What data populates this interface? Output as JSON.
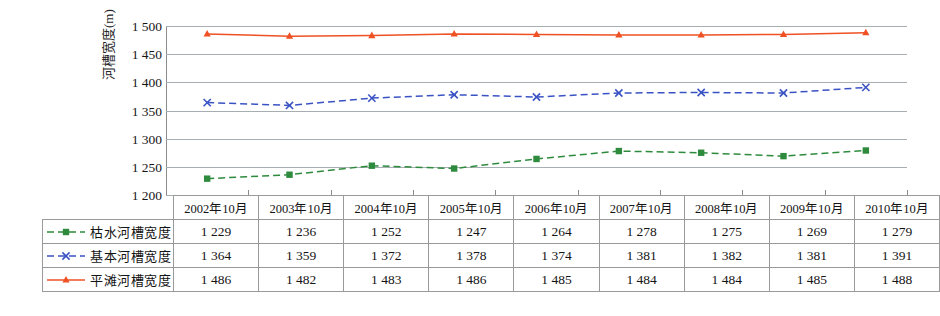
{
  "chart_data": {
    "type": "line",
    "title": "",
    "xlabel": "",
    "ylabel": "河槽宽度(m)",
    "ylim": [
      1200,
      1500
    ],
    "ytick_step": 50,
    "yticks": [
      "1 200",
      "1 250",
      "1 300",
      "1 350",
      "1 400",
      "1 450",
      "1 500"
    ],
    "grid": true,
    "legend_position": "table-left",
    "categories": [
      "2002年10月",
      "2003年10月",
      "2004年10月",
      "2005年10月",
      "2006年10月",
      "2007年10月",
      "2008年10月",
      "2009年10月",
      "2010年10月"
    ],
    "series": [
      {
        "name": "枯水河槽宽度",
        "color": "#2e8b3d",
        "marker": "square",
        "dash": "dashed",
        "values": [
          1229,
          1236,
          1252,
          1247,
          1264,
          1278,
          1275,
          1269,
          1279
        ],
        "labels": [
          "1 229",
          "1 236",
          "1 252",
          "1 247",
          "1 264",
          "1 278",
          "1 275",
          "1 269",
          "1 279"
        ]
      },
      {
        "name": "基本河槽宽度",
        "color": "#3a53c4",
        "marker": "x",
        "dash": "dashed",
        "values": [
          1364,
          1359,
          1372,
          1378,
          1374,
          1381,
          1382,
          1381,
          1391
        ],
        "labels": [
          "1 364",
          "1 359",
          "1 372",
          "1 378",
          "1 374",
          "1 381",
          "1 382",
          "1 381",
          "1 391"
        ]
      },
      {
        "name": "平滩河槽宽度",
        "color": "#ef5124",
        "marker": "triangle",
        "dash": "solid",
        "values": [
          1486,
          1482,
          1483,
          1486,
          1485,
          1484,
          1484,
          1485,
          1488
        ],
        "labels": [
          "1 486",
          "1 482",
          "1 483",
          "1 486",
          "1 485",
          "1 484",
          "1 484",
          "1 485",
          "1 488"
        ]
      }
    ]
  },
  "table": {
    "header_corner": "",
    "columns": [
      "2002年10月",
      "2003年10月",
      "2004年10月",
      "2005年10月",
      "2006年10月",
      "2007年10月",
      "2008年10月",
      "2009年10月",
      "2010年10月"
    ],
    "rows": [
      {
        "label": "枯水河槽宽度",
        "values": [
          "1 229",
          "1 236",
          "1 252",
          "1 247",
          "1 264",
          "1 278",
          "1 275",
          "1 269",
          "1 279"
        ]
      },
      {
        "label": "基本河槽宽度",
        "values": [
          "1 364",
          "1 359",
          "1 372",
          "1 378",
          "1 374",
          "1 381",
          "1 382",
          "1 381",
          "1 391"
        ]
      },
      {
        "label": "平滩河槽宽度",
        "values": [
          "1 486",
          "1 482",
          "1 483",
          "1 486",
          "1 485",
          "1 484",
          "1 484",
          "1 485",
          "1 488"
        ]
      }
    ]
  },
  "colors": {
    "green": "#2e8b3d",
    "blue": "#3a53c4",
    "red": "#ef5124",
    "gridline": "#a6aeb2",
    "axis": "#8c8c8c",
    "table_border": "#9a9a9a"
  }
}
